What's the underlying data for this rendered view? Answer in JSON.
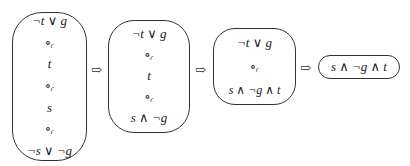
{
  "boxes": [
    {
      "items": [
        "¬t ∨ g",
        "∘ᵣ",
        "t",
        "∘ᵣ",
        "s",
        "∘ᵣ",
        "¬s ∨ ¬g"
      ]
    },
    {
      "items": [
        "¬t ∨ g",
        "∘ᵣ",
        "t",
        "∘ᵣ",
        "s ∧ ¬g"
      ]
    },
    {
      "items": [
        "¬t ∨ g",
        "∘ᵣ",
        "s ∧ ¬g ∧ t"
      ]
    },
    {
      "items": [
        "s ∧ ¬g ∧ t"
      ]
    }
  ],
  "arrow_glyph": "⇨"
}
